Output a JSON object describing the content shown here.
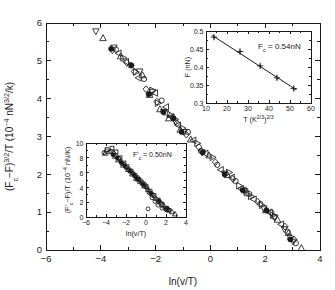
{
  "figure": {
    "background": "#ffffff",
    "foreground": "#1a1a1a",
    "width": 335,
    "height": 290
  },
  "chart_data": [
    {
      "id": "main",
      "type": "scatter",
      "title": "",
      "xlabel": "ln(v/T)",
      "ylabel": "(Fc−F)3/2/T (10−4 nN3/2/k)",
      "ylabel_parts": {
        "p1": "(F",
        "sub1": "c",
        "p2": "−F)",
        "sup1": "3/2",
        "p3": "/T (10",
        "sup2": "−4",
        "p4": " nN",
        "sup3": "3/2",
        "p5": "/k)"
      },
      "xlim": [
        -6,
        4
      ],
      "ylim": [
        0,
        6
      ],
      "xticks": [
        -6,
        -4,
        -2,
        0,
        2,
        4
      ],
      "xticklabels": [
        "−6",
        "−4",
        "−2",
        "0",
        "2",
        "4"
      ],
      "yticks": [
        0,
        1,
        2,
        3,
        4,
        5,
        6
      ],
      "yticklabels": [
        "0",
        "1",
        "2",
        "3",
        "4",
        "5",
        "6"
      ],
      "xminor": [
        -5,
        -3,
        -1,
        1,
        3
      ],
      "yminor": [
        0.5,
        1.5,
        2.5,
        3.5,
        4.5,
        5.5
      ],
      "grid": false,
      "legend": "none",
      "series": [
        {
          "name": "down-triangle",
          "marker": "triangle-down",
          "fill": "open",
          "points": [
            [
              -4.18,
              5.78
            ],
            [
              -3.52,
              5.35
            ],
            [
              -2.58,
              4.72
            ],
            [
              -2.12,
              4.18
            ],
            [
              -1.7,
              3.65
            ],
            [
              -1.28,
              3.4
            ],
            [
              -0.95,
              3.12
            ],
            [
              -0.3,
              2.58
            ],
            [
              0.52,
              2.02
            ],
            [
              1.22,
              1.56
            ],
            [
              1.95,
              1.1
            ],
            [
              2.35,
              0.86
            ],
            [
              2.7,
              0.55
            ],
            [
              3.02,
              0.22
            ]
          ]
        },
        {
          "name": "up-triangle",
          "marker": "triangle-up",
          "fill": "open",
          "points": [
            [
              -3.92,
              5.6
            ],
            [
              -3.28,
              5.12
            ],
            [
              -2.48,
              4.62
            ],
            [
              -2.22,
              4.1
            ],
            [
              -1.84,
              3.72
            ],
            [
              -1.52,
              3.48
            ],
            [
              -1.1,
              3.18
            ],
            [
              -0.72,
              2.92
            ],
            [
              -0.05,
              2.5
            ],
            [
              0.62,
              1.98
            ],
            [
              1.35,
              1.5
            ],
            [
              2.02,
              1.05
            ],
            [
              2.45,
              0.8
            ],
            [
              2.85,
              0.45
            ],
            [
              3.32,
              0.05
            ]
          ]
        },
        {
          "name": "left-triangle",
          "marker": "triangle-left",
          "fill": "open",
          "points": [
            [
              -3.35,
              5.2
            ],
            [
              -3.08,
              4.98
            ],
            [
              -2.62,
              4.55
            ],
            [
              -2.02,
              4.15
            ],
            [
              -1.62,
              3.78
            ],
            [
              -1.42,
              3.52
            ],
            [
              -1.18,
              3.3
            ],
            [
              -0.62,
              2.9
            ],
            [
              -0.18,
              2.55
            ],
            [
              0.38,
              2.12
            ],
            [
              0.78,
              1.92
            ],
            [
              1.12,
              1.62
            ],
            [
              1.58,
              1.34
            ],
            [
              2.18,
              0.98
            ],
            [
              2.58,
              0.68
            ]
          ]
        },
        {
          "name": "right-triangle",
          "marker": "triangle-right",
          "fill": "open",
          "points": [
            [
              -3.18,
              5.08
            ],
            [
              -2.72,
              4.7
            ],
            [
              -2.12,
              4.22
            ],
            [
              -1.92,
              3.88
            ],
            [
              -1.48,
              3.58
            ],
            [
              -1.02,
              3.22
            ],
            [
              -0.48,
              2.82
            ],
            [
              0.08,
              2.45
            ],
            [
              0.68,
              2.05
            ],
            [
              1.05,
              1.7
            ],
            [
              1.48,
              1.42
            ],
            [
              1.88,
              1.18
            ],
            [
              2.28,
              0.92
            ],
            [
              2.92,
              0.35
            ]
          ]
        },
        {
          "name": "diamond",
          "marker": "diamond",
          "fill": "open",
          "points": [
            [
              -3.58,
              5.28
            ],
            [
              -3.05,
              4.95
            ],
            [
              -2.78,
              4.72
            ],
            [
              -2.35,
              4.25
            ],
            [
              -1.95,
              3.92
            ],
            [
              -1.58,
              3.62
            ],
            [
              -1.22,
              3.35
            ],
            [
              -0.88,
              3.05
            ],
            [
              -0.42,
              2.72
            ],
            [
              0.18,
              2.32
            ],
            [
              0.82,
              1.88
            ],
            [
              1.28,
              1.58
            ],
            [
              1.72,
              1.28
            ],
            [
              2.22,
              1.0
            ],
            [
              2.72,
              0.62
            ],
            [
              3.05,
              0.28
            ]
          ]
        },
        {
          "name": "open-circle",
          "marker": "circle",
          "fill": "open",
          "points": [
            [
              -3.45,
              5.3
            ],
            [
              -2.92,
              4.88
            ],
            [
              -2.42,
              4.52
            ],
            [
              -1.78,
              3.95
            ],
            [
              -1.35,
              3.48
            ],
            [
              -0.82,
              3.12
            ],
            [
              -0.35,
              2.62
            ],
            [
              0.25,
              2.25
            ],
            [
              0.92,
              1.82
            ],
            [
              1.42,
              1.48
            ],
            [
              1.82,
              1.22
            ],
            [
              2.32,
              0.88
            ],
            [
              2.82,
              0.48
            ],
            [
              3.12,
              0.18
            ]
          ]
        },
        {
          "name": "filled-circle",
          "marker": "circle",
          "fill": "filled",
          "points": [
            [
              -3.62,
              5.32
            ],
            [
              -2.88,
              4.88
            ],
            [
              -2.25,
              4.12
            ],
            [
              -1.72,
              3.65
            ],
            [
              -1.35,
              3.48
            ],
            [
              -1.05,
              3.12
            ],
            [
              -0.28,
              2.58
            ],
            [
              0.52,
              2.0
            ],
            [
              1.18,
              1.58
            ],
            [
              2.05,
              1.05
            ],
            [
              2.92,
              0.28
            ]
          ]
        }
      ]
    },
    {
      "id": "inset-top-right",
      "type": "scatter",
      "title": "",
      "xlabel": "T2/3 (K2/3)",
      "xlabel_parts": {
        "p1": "T",
        "sup1": "2/3",
        "p2": " (K",
        "sup2": "2/3",
        "p3": ")"
      },
      "ylabel": "F (nN)",
      "xlim": [
        10,
        60
      ],
      "ylim": [
        0.3,
        0.5
      ],
      "xticks": [
        10,
        20,
        30,
        40,
        50,
        60
      ],
      "xticklabels": [
        "10",
        "20",
        "30",
        "40",
        "50",
        "60"
      ],
      "yticks": [
        0.3,
        0.35,
        0.4,
        0.45,
        0.5
      ],
      "yticklabels": [
        "0.3",
        "0.35",
        "0.4",
        "0.45",
        "0.5"
      ],
      "grid": false,
      "annotation": "Fc = 0.54nN",
      "annotation_parts": {
        "p1": "F",
        "sub1": "c",
        "p2": " = 0.54nN"
      },
      "points": [
        [
          13.8,
          0.483
        ],
        [
          26.2,
          0.443
        ],
        [
          35.8,
          0.403
        ],
        [
          43.8,
          0.37
        ],
        [
          51.8,
          0.34
        ]
      ],
      "errors": [
        0.006,
        0.006,
        0.006,
        0.006,
        0.006
      ],
      "fit": {
        "x": [
          13.0,
          53.0
        ],
        "y": [
          0.4875,
          0.3365
        ]
      },
      "marker": "plus"
    },
    {
      "id": "inset-bottom-left",
      "type": "scatter",
      "title": "",
      "xlabel": "ln(v/T)",
      "ylabel": "(F'c−F)/T (10−4 nN/K)",
      "ylabel_parts": {
        "p1": "(F'",
        "sub1": "c",
        "p2": "−F)/T (10",
        "sup1": "−4",
        "p3": " nN/K)"
      },
      "xlim": [
        -6,
        4
      ],
      "ylim": [
        0,
        10
      ],
      "xticks": [
        -6,
        -4,
        -2,
        0,
        2,
        4
      ],
      "xticklabels": [
        "−6",
        "−4",
        "−2",
        "0",
        "2",
        "4"
      ],
      "yticks": [
        0,
        2,
        4,
        6,
        8,
        10
      ],
      "yticklabels": [
        "0",
        "2",
        "4",
        "6",
        "8",
        "10"
      ],
      "grid": false,
      "annotation": "F'c = 0.50nN",
      "annotation_parts": {
        "p1": "F'",
        "sub1": "c",
        "p2": " = 0.50nN"
      },
      "series": [
        {
          "name": "open-circle",
          "marker": "circle",
          "fill": "open",
          "points": [
            [
              -4.2,
              8.7
            ],
            [
              -3.5,
              8.9
            ],
            [
              -3.0,
              8.3
            ],
            [
              -2.7,
              7.9
            ],
            [
              -2.4,
              7.2
            ],
            [
              -2.0,
              6.7
            ],
            [
              -1.7,
              6.3
            ],
            [
              -1.3,
              5.9
            ],
            [
              -1.0,
              5.4
            ],
            [
              -0.7,
              5.0
            ],
            [
              -0.5,
              4.9
            ],
            [
              -0.2,
              4.3
            ],
            [
              0.1,
              3.9
            ],
            [
              0.3,
              3.3
            ],
            [
              0.6,
              2.6
            ],
            [
              0.9,
              2.1
            ],
            [
              1.2,
              1.6
            ],
            [
              0.2,
              1.1
            ],
            [
              1.6,
              1.2
            ],
            [
              2.0,
              1.0
            ]
          ]
        },
        {
          "name": "square",
          "marker": "square",
          "fill": "open",
          "points": [
            [
              -3.9,
              9.1
            ],
            [
              -3.4,
              9.3
            ],
            [
              -3.0,
              8.8
            ],
            [
              -2.6,
              8.0
            ],
            [
              -2.2,
              7.3
            ],
            [
              -1.9,
              6.8
            ],
            [
              -1.5,
              6.2
            ],
            [
              -1.1,
              5.6
            ],
            [
              -0.8,
              5.1
            ],
            [
              -0.4,
              4.6
            ],
            [
              0.0,
              4.1
            ],
            [
              0.4,
              3.5
            ],
            [
              0.8,
              2.9
            ],
            [
              1.2,
              2.3
            ],
            [
              1.6,
              1.7
            ],
            [
              2.0,
              1.2
            ],
            [
              2.3,
              0.9
            ]
          ]
        },
        {
          "name": "triangle-up",
          "marker": "triangle-up",
          "fill": "open",
          "points": [
            [
              -4.1,
              8.6
            ],
            [
              -3.6,
              8.8
            ],
            [
              -3.1,
              8.2
            ],
            [
              -2.8,
              7.7
            ],
            [
              -2.3,
              7.0
            ],
            [
              -1.8,
              6.4
            ],
            [
              -1.4,
              5.8
            ],
            [
              -1.0,
              5.2
            ],
            [
              -0.6,
              4.8
            ],
            [
              -0.2,
              4.2
            ],
            [
              0.2,
              3.7
            ],
            [
              0.6,
              3.1
            ],
            [
              1.0,
              2.5
            ],
            [
              1.4,
              2.0
            ],
            [
              1.8,
              1.5
            ],
            [
              2.2,
              1.0
            ],
            [
              2.6,
              0.7
            ],
            [
              2.9,
              0.4
            ]
          ]
        },
        {
          "name": "filled-circle",
          "marker": "circle",
          "fill": "filled",
          "points": [
            [
              -3.3,
              8.4
            ],
            [
              -2.9,
              8.0
            ],
            [
              -2.5,
              7.4
            ],
            [
              -2.1,
              6.9
            ],
            [
              -1.6,
              6.2
            ],
            [
              -1.2,
              5.7
            ],
            [
              -0.9,
              5.2
            ],
            [
              -0.3,
              4.4
            ],
            [
              0.5,
              3.2
            ],
            [
              1.3,
              2.2
            ],
            [
              2.1,
              1.1
            ]
          ]
        },
        {
          "name": "diamond",
          "marker": "diamond",
          "fill": "open",
          "points": [
            [
              -4.0,
              8.9
            ],
            [
              -3.2,
              8.6
            ],
            [
              -2.7,
              7.8
            ],
            [
              -2.2,
              7.1
            ],
            [
              -1.7,
              6.5
            ],
            [
              -1.3,
              5.9
            ],
            [
              -0.8,
              5.3
            ],
            [
              -0.1,
              4.4
            ],
            [
              0.7,
              3.0
            ],
            [
              1.5,
              1.9
            ],
            [
              2.2,
              1.1
            ]
          ]
        }
      ]
    }
  ]
}
